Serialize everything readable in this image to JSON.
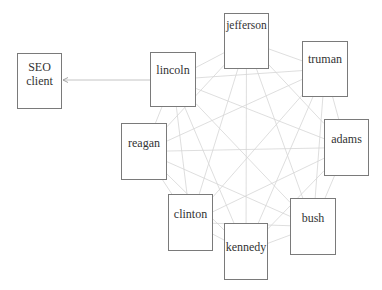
{
  "diagram": {
    "nodes": [
      {
        "id": "seo",
        "label": "SEO client"
      },
      {
        "id": "lincoln",
        "label": "lincoln"
      },
      {
        "id": "jefferson",
        "label": "jefferson"
      },
      {
        "id": "truman",
        "label": "truman"
      },
      {
        "id": "reagan",
        "label": "reagan"
      },
      {
        "id": "adams",
        "label": "adams"
      },
      {
        "id": "clinton",
        "label": "clinton"
      },
      {
        "id": "kennedy",
        "label": "kennedy"
      },
      {
        "id": "bush",
        "label": "bush"
      }
    ],
    "mesh_nodes": [
      "lincoln",
      "jefferson",
      "truman",
      "adams",
      "bush",
      "kennedy",
      "clinton",
      "reagan"
    ],
    "directed_edges": [
      {
        "from": "lincoln",
        "to": "seo"
      }
    ],
    "colors": {
      "border": "#7a7a7a",
      "mesh_edge": "#d6d6d6",
      "arrow": "#bdbdbd",
      "text": "#333333"
    }
  }
}
